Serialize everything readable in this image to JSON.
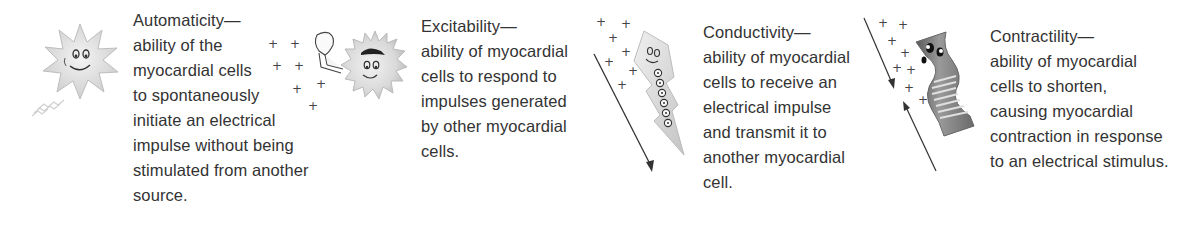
{
  "properties": [
    {
      "title": "Automaticity—",
      "lines": [
        "ability of the",
        "myocardial cells",
        "to spontaneously",
        "initiate an electrical",
        "impulse without being",
        "stimulated from another",
        "source."
      ],
      "illustration": "smiling-star-cell-and-waving-cell-icon"
    },
    {
      "title": "Excitability—",
      "lines": [
        "ability of myocardial",
        "cells to respond to",
        "impulses generated",
        "by other myocardial",
        "cells."
      ],
      "illustration": "lightning-bolt-cell-with-arrow-icon"
    },
    {
      "title": "Conductivity—",
      "lines": [
        "ability of myocardial",
        "cells to receive an",
        "electrical impulse",
        "and transmit it to",
        "another myocardial",
        "cell."
      ],
      "illustration": "lightning-bolt-cell-transmitting-icon"
    },
    {
      "title": "Contractility—",
      "lines": [
        "ability of myocardial",
        "cells to shorten,",
        "causing myocardial",
        "contraction in response",
        "to an electrical stimulus."
      ],
      "illustration": "contracting-muscle-cell-icon"
    }
  ],
  "symbols": {
    "charge": "+"
  },
  "colors": {
    "text": "#333333",
    "illustration_fill": "#e6e6e6",
    "illustration_stroke": "#9a9a9a",
    "arrow": "#333333"
  }
}
